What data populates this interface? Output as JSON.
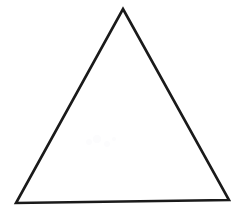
{
  "figure": {
    "title": "Triangle",
    "description": "Outline drawing of a triangle",
    "caption": "",
    "background_color": "#ffffff",
    "stroke_color": "#1a1a1a",
    "fill": "none",
    "stroke_width": 2.6,
    "canvas": {
      "width": 233,
      "height": 208
    }
  },
  "chart_data": {
    "type": "scatter",
    "title": "Triangle",
    "xlabel": "",
    "ylabel": "",
    "xlim": [
      0,
      233
    ],
    "ylim": [
      0,
      208
    ],
    "grid": false,
    "legend": "none",
    "annotations": [],
    "shapes": [
      {
        "name": "triangle",
        "kind": "polygon",
        "closed": true,
        "fill": "none",
        "stroke": "#1a1a1a",
        "stroke_width": 2.6,
        "vertices": [
          {
            "label": "apex",
            "x": 123,
            "y": 9
          },
          {
            "label": "bottom-right",
            "x": 229,
            "y": 200
          },
          {
            "label": "bottom-left",
            "x": 16,
            "y": 203
          }
        ],
        "points_attr": "123,9 229,200 16,203"
      }
    ],
    "edges": [
      {
        "name": "left-edge",
        "from": "apex",
        "to": "bottom-left"
      },
      {
        "name": "right-edge",
        "from": "apex",
        "to": "bottom-right"
      },
      {
        "name": "base-edge",
        "from": "bottom-left",
        "to": "bottom-right"
      }
    ],
    "specks": [
      {
        "x": 88,
        "y": 141,
        "r": 3
      },
      {
        "x": 97,
        "y": 139,
        "r": 4
      },
      {
        "x": 106,
        "y": 143,
        "r": 3
      },
      {
        "x": 113,
        "y": 138,
        "r": 2
      }
    ]
  }
}
